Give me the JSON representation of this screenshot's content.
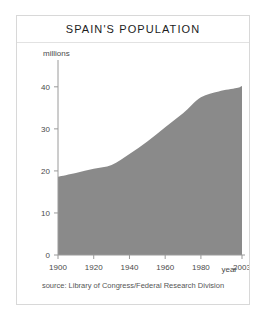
{
  "figure": {
    "title": "SPAIN'S POPULATION",
    "source": "source: Library of Congress/Federal Research Division",
    "xlabel": "year",
    "ylabel": "millions",
    "area_color": "#8a8a8a",
    "axis_color": "#9a9a9a",
    "border_color": "#d8d8d8"
  },
  "chart_data": {
    "type": "area",
    "title": "SPAIN'S POPULATION",
    "xlabel": "year",
    "ylabel": "millions",
    "xlim": [
      1900,
      2003
    ],
    "ylim": [
      0,
      44
    ],
    "xticks": [
      1900,
      1920,
      1940,
      1960,
      1980,
      2003
    ],
    "yticks": [
      0,
      10,
      20,
      30,
      40
    ],
    "grid": false,
    "legend": null,
    "x": [
      1900,
      1910,
      1920,
      1930,
      1940,
      1950,
      1960,
      1970,
      1980,
      1990,
      2000,
      2003
    ],
    "values": [
      18.6,
      19.5,
      20.5,
      21.4,
      24.0,
      27.0,
      30.4,
      33.7,
      37.5,
      38.9,
      39.7,
      40.2
    ],
    "series": [
      {
        "name": "Population (millions)",
        "values": [
          18.6,
          19.5,
          20.5,
          21.4,
          24.0,
          27.0,
          30.4,
          33.7,
          37.5,
          38.9,
          39.7,
          40.2
        ]
      }
    ]
  }
}
